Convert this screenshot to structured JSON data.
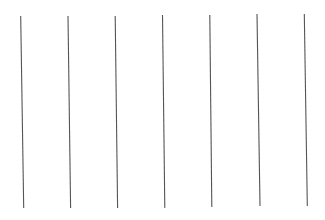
{
  "figure": {
    "width": 325,
    "height": 220,
    "background": "#ffffff",
    "line_color": "#555555",
    "line_width": 1.1,
    "lines": [
      {
        "x1": 20.7,
        "y1": 16,
        "x2": 23.7,
        "y2": 208
      },
      {
        "x1": 68.0,
        "y1": 16,
        "x2": 70.6,
        "y2": 208
      },
      {
        "x1": 115.2,
        "y1": 16,
        "x2": 117.6,
        "y2": 208
      },
      {
        "x1": 162.5,
        "y1": 15,
        "x2": 164.8,
        "y2": 208
      },
      {
        "x1": 209.8,
        "y1": 15,
        "x2": 211.8,
        "y2": 207
      },
      {
        "x1": 257.0,
        "y1": 14,
        "x2": 260.0,
        "y2": 206
      },
      {
        "x1": 304.3,
        "y1": 14,
        "x2": 307.3,
        "y2": 206
      }
    ]
  }
}
